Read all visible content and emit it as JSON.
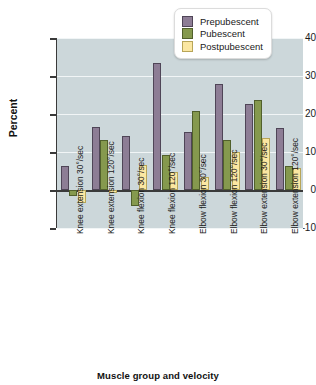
{
  "chart_data": {
    "type": "bar",
    "title": "",
    "xlabel": "Muscle group and velocity",
    "ylabel": "Percent",
    "ylim": [
      -10,
      40
    ],
    "yticks": [
      -10,
      0,
      10,
      20,
      30,
      40
    ],
    "grid": true,
    "legend_position": "top-right",
    "categories": [
      "Knee extension 30°/sec",
      "Knee extension 120°/sec",
      "Knee flexion 30°/sec",
      "Knee flexion 120°/sec",
      "Elbow flexion 30°/sec",
      "Elbow flexion 120°/sec",
      "Elbow extension 30°/sec",
      "Elbow extension 120°/sec"
    ],
    "series": [
      {
        "name": "Prepubescent",
        "color": "#8d7d95",
        "values": [
          6.3,
          16.7,
          14.1,
          33.4,
          15.2,
          27.9,
          22.6,
          16.2
        ]
      },
      {
        "name": "Pubescent",
        "color": "#85994e",
        "values": [
          -1.5,
          13.2,
          -4.3,
          9.3,
          20.9,
          13.2,
          23.6,
          6.2
        ]
      },
      {
        "name": "Postpubescent",
        "color": "#fbe7a2",
        "values": [
          -3.5,
          -0.7,
          6.6,
          4.7,
          3.4,
          10.0,
          13.6,
          5.8
        ]
      }
    ]
  },
  "legend": {
    "items": [
      {
        "label": "Prepubescent"
      },
      {
        "label": "Pubescent"
      },
      {
        "label": "Postpubescent"
      }
    ]
  }
}
